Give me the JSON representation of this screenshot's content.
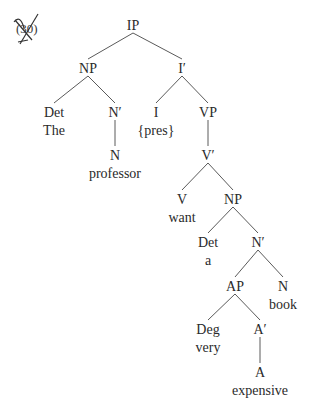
{
  "example": {
    "number_label": "(30)",
    "crossed_out": true
  },
  "colors": {
    "text": "#2a2a2a",
    "edge": "#5a5a5a",
    "background": "#ffffff"
  },
  "tree": {
    "nodes": [
      {
        "id": "IP",
        "label": "IP",
        "x": 133,
        "y": 25
      },
      {
        "id": "NP1",
        "label": "NP",
        "x": 88,
        "y": 68
      },
      {
        "id": "I_bar",
        "label": "I′",
        "x": 182,
        "y": 68
      },
      {
        "id": "Det1",
        "label": "Det",
        "x": 54,
        "y": 112,
        "word": "The"
      },
      {
        "id": "N_bar1",
        "label": "N′",
        "x": 115,
        "y": 112
      },
      {
        "id": "N1",
        "label": "N",
        "x": 115,
        "y": 155,
        "word": "professor"
      },
      {
        "id": "I",
        "label": "I",
        "x": 156,
        "y": 112,
        "word": "{pres}"
      },
      {
        "id": "VP",
        "label": "VP",
        "x": 208,
        "y": 112
      },
      {
        "id": "V_bar",
        "label": "V′",
        "x": 208,
        "y": 155
      },
      {
        "id": "V",
        "label": "V",
        "x": 182,
        "y": 199,
        "word": "want"
      },
      {
        "id": "NP2",
        "label": "NP",
        "x": 233,
        "y": 199
      },
      {
        "id": "Det2",
        "label": "Det",
        "x": 208,
        "y": 242,
        "word": "a"
      },
      {
        "id": "N_bar2",
        "label": "N′",
        "x": 258,
        "y": 242
      },
      {
        "id": "AP",
        "label": "AP",
        "x": 235,
        "y": 286
      },
      {
        "id": "N2",
        "label": "N",
        "x": 283,
        "y": 286,
        "word": "book"
      },
      {
        "id": "Deg",
        "label": "Deg",
        "x": 208,
        "y": 329,
        "word": "very"
      },
      {
        "id": "A_bar",
        "label": "A′",
        "x": 260,
        "y": 329
      },
      {
        "id": "A",
        "label": "A",
        "x": 260,
        "y": 372,
        "word": "expensive"
      }
    ],
    "edges": [
      [
        "IP",
        "NP1"
      ],
      [
        "IP",
        "I_bar"
      ],
      [
        "NP1",
        "Det1"
      ],
      [
        "NP1",
        "N_bar1"
      ],
      [
        "N_bar1",
        "N1"
      ],
      [
        "I_bar",
        "I"
      ],
      [
        "I_bar",
        "VP"
      ],
      [
        "VP",
        "V_bar"
      ],
      [
        "V_bar",
        "V"
      ],
      [
        "V_bar",
        "NP2"
      ],
      [
        "NP2",
        "Det2"
      ],
      [
        "NP2",
        "N_bar2"
      ],
      [
        "N_bar2",
        "AP"
      ],
      [
        "N_bar2",
        "N2"
      ],
      [
        "AP",
        "Deg"
      ],
      [
        "AP",
        "A_bar"
      ],
      [
        "A_bar",
        "A"
      ]
    ],
    "sentence": "The professor {pres} want a very expensive book"
  }
}
